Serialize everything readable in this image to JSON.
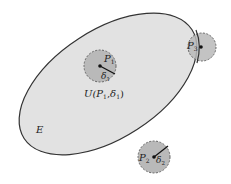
{
  "diagram": {
    "type": "set-neighborhood-illustration",
    "colors": {
      "background": "#ffffff",
      "set_fill": "#e2e2e2",
      "set_stroke": "#333333",
      "ball_fill": "#b9b9b9",
      "ball_stroke": "#666666",
      "point": "#111111",
      "text": "#222222"
    },
    "set": {
      "label": "E"
    },
    "points": [
      {
        "id": "P1",
        "label": "P",
        "sub": "1",
        "radius_label": "δ",
        "radius_sub": "1",
        "relation": "interior point"
      },
      {
        "id": "P3",
        "label": "P",
        "sub": "3",
        "relation": "boundary point"
      },
      {
        "id": "P2",
        "label": "P",
        "sub": "2",
        "radius_label": "δ",
        "radius_sub": "2",
        "relation": "exterior point"
      }
    ],
    "neighborhood_label": {
      "text_u": "U(",
      "text_p": "P",
      "p_sub": "1",
      "comma": ",",
      "text_d": "δ",
      "d_sub": "1",
      "close": ")"
    }
  }
}
